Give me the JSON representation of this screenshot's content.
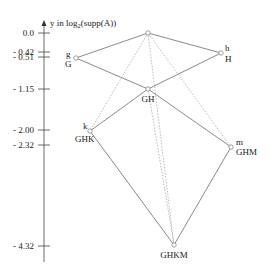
{
  "axis": {
    "label_prefix": "y in log",
    "label_sub": "2",
    "label_suffix": "(supp(A))",
    "ticks": [
      {
        "label": "0.0",
        "y": 33
      },
      {
        "label": "- 0.42",
        "y": 52
      },
      {
        "label": "- 0.51",
        "y": 57
      },
      {
        "label": "- 1.15",
        "y": 89
      },
      {
        "label": "- 2.00",
        "y": 130
      },
      {
        "label": "- 2.32",
        "y": 145
      },
      {
        "label": "- 4.32",
        "y": 246
      }
    ]
  },
  "nodes": [
    {
      "id": "top",
      "x": 148,
      "y": 33,
      "upper": "",
      "lower": ""
    },
    {
      "id": "G",
      "x": 76,
      "y": 58,
      "upper": "g",
      "lower": "G"
    },
    {
      "id": "H",
      "x": 221,
      "y": 53,
      "upper": "h",
      "lower": "H"
    },
    {
      "id": "GH",
      "x": 148,
      "y": 89,
      "upper": "",
      "lower": "GH"
    },
    {
      "id": "GHK",
      "x": 90,
      "y": 131,
      "upper": "k",
      "lower": "GHK"
    },
    {
      "id": "GHM",
      "x": 231,
      "y": 147,
      "upper": "m",
      "lower": "GHM"
    },
    {
      "id": "GHKM",
      "x": 174,
      "y": 245,
      "upper": "",
      "lower": "GHKM"
    }
  ],
  "edges_solid": [
    [
      "top",
      "G"
    ],
    [
      "top",
      "H"
    ],
    [
      "G",
      "GH"
    ],
    [
      "H",
      "GH"
    ],
    [
      "GH",
      "GHK"
    ],
    [
      "GH",
      "GHM"
    ],
    [
      "GHK",
      "GHKM"
    ],
    [
      "GHM",
      "GHKM"
    ]
  ],
  "edges_dotted": [
    [
      "top",
      "GHK"
    ],
    [
      "top",
      "GHKM"
    ],
    [
      "top",
      "GHM"
    ],
    [
      "GH",
      "GHKM"
    ]
  ]
}
